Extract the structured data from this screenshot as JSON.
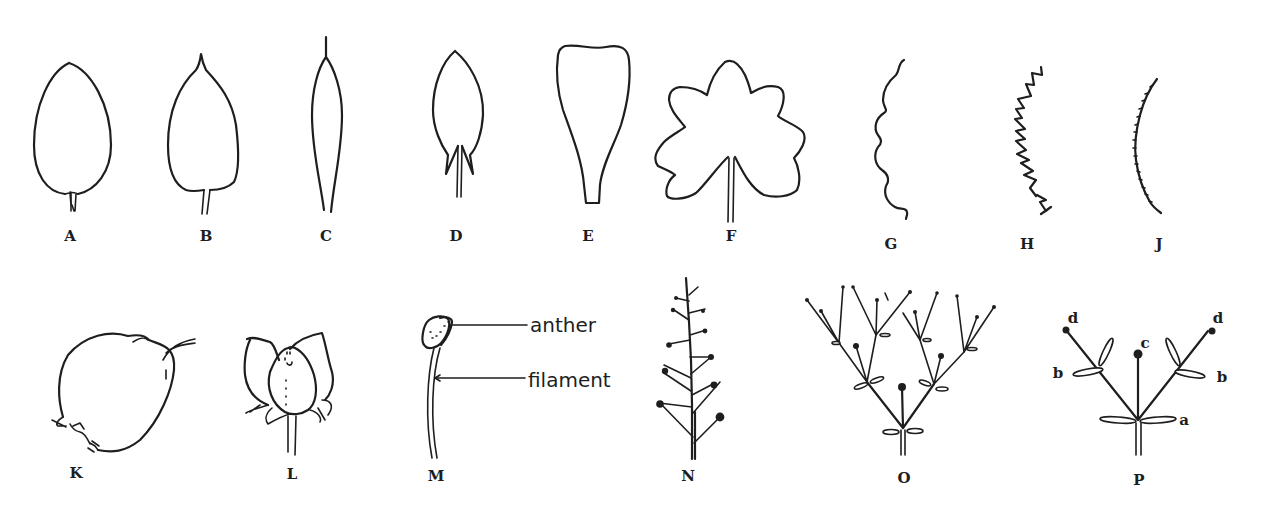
{
  "figure": {
    "background_color": "#ffffff",
    "ink_color": "#1e1e1e"
  },
  "panels": [
    {
      "id": "A",
      "label": "A",
      "subject": "ovate leaf, rounded tip"
    },
    {
      "id": "B",
      "label": "B",
      "subject": "ovate leaf, pointed tip"
    },
    {
      "id": "C",
      "label": "C",
      "subject": "narrow lanceolate leaf with bristle tip"
    },
    {
      "id": "D",
      "label": "D",
      "subject": "leaf with basal lobes (hastate/sagittate base)"
    },
    {
      "id": "E",
      "label": "E",
      "subject": "spatulate/obovate leaf"
    },
    {
      "id": "F",
      "label": "F",
      "subject": "palmately lobed leaf"
    },
    {
      "id": "G",
      "label": "G",
      "subject": "crenate/scalloped margin"
    },
    {
      "id": "H",
      "label": "H",
      "subject": "serrate/toothed margin"
    },
    {
      "id": "J",
      "label": "J",
      "subject": "finely serrulate margin"
    },
    {
      "id": "K",
      "label": "K",
      "subject": "fruit/capsule"
    },
    {
      "id": "L",
      "label": "L",
      "subject": "flower with petals"
    },
    {
      "id": "M",
      "label": "M",
      "subject": "stamen",
      "callouts": [
        "anther",
        "filament"
      ]
    },
    {
      "id": "N",
      "label": "N",
      "subject": "raceme inflorescence"
    },
    {
      "id": "O",
      "label": "O",
      "subject": "compound dichasial cyme"
    },
    {
      "id": "P",
      "label": "P",
      "subject": "simple cyme with lettered parts",
      "part_labels": [
        "a",
        "b",
        "b",
        "c",
        "d",
        "d"
      ]
    }
  ],
  "callouts": {
    "anther": "anther",
    "filament": "filament"
  },
  "part_labels": {
    "a": "a",
    "b_left": "b",
    "b_right": "b",
    "c": "c",
    "d_left": "d",
    "d_right": "d"
  }
}
